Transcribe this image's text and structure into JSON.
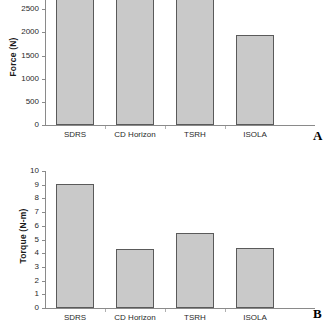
{
  "figure": {
    "panel_a_letter": "A",
    "panel_b_letter": "B"
  },
  "chart_data": [
    {
      "panel": "A",
      "type": "bar",
      "title": "",
      "xlabel": "",
      "ylabel": "Force (N)",
      "categories": [
        "SDRS",
        "CD Horizon",
        "TSRH",
        "ISOLA"
      ],
      "values": [
        3300,
        3300,
        3280,
        1950
      ],
      "ylim": [
        0,
        3000
      ],
      "yticks": [
        0,
        500,
        1000,
        1500,
        2000,
        2500,
        3000
      ],
      "ytick_labels": [
        "0",
        "500",
        "1000",
        "1500",
        "2000",
        "2500",
        "3000"
      ],
      "grid": false,
      "legend": "none",
      "note": "plot area is cropped at the top of the image; the first three bars extend past the 3000 tick and are clipped"
    },
    {
      "panel": "B",
      "type": "bar",
      "title": "",
      "xlabel": "",
      "ylabel": "Torque (N-m)",
      "categories": [
        "SDRS",
        "CD Horizon",
        "TSRH",
        "ISOLA"
      ],
      "values": [
        9.05,
        4.3,
        5.5,
        4.4
      ],
      "ylim": [
        0,
        10
      ],
      "yticks": [
        0,
        1,
        2,
        3,
        4,
        5,
        6,
        7,
        8,
        9,
        10
      ],
      "ytick_labels": [
        "0",
        "1",
        "2",
        "3",
        "4",
        "5",
        "6",
        "7",
        "8",
        "9",
        "10"
      ],
      "grid": false,
      "legend": "none"
    }
  ],
  "colors": {
    "bar_fill": "#c9c9c9",
    "bar_stroke": "#5a5a5a",
    "axis": "#8a8a8a",
    "text": "#1a1a1a",
    "background": "#ffffff"
  }
}
